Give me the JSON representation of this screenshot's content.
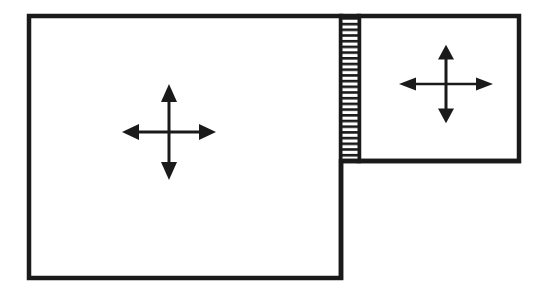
{
  "diagram": {
    "type": "window-layout",
    "colors": {
      "stroke": "#1a1a1a",
      "background": "#ffffff",
      "splitter_stripe": "#1a1a1a"
    },
    "panes": [
      {
        "id": "main-pane",
        "icon": "move-arrows-icon",
        "x": 27,
        "y": 14,
        "width": 316,
        "height": 266
      },
      {
        "id": "side-pane",
        "icon": "move-arrows-icon",
        "x": 358,
        "y": 14,
        "width": 163,
        "height": 148
      }
    ],
    "splitter": {
      "id": "splitter-handle",
      "x": 340,
      "y": 14,
      "width": 19,
      "height": 148,
      "stripe_count": 26
    }
  }
}
